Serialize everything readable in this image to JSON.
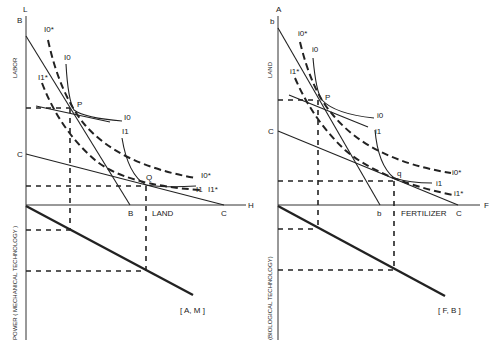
{
  "panels": [
    {
      "id": "mechanical",
      "axis_top": "L",
      "axis_right": "H",
      "y_label_upper": "LABOR",
      "y_label_lower": "POWER ( MECHANICAL TECHNOLOGY )",
      "x_label": "LAND",
      "intercept_top": "B",
      "intercept_mid": "C",
      "x_intercept_1": "B",
      "x_intercept_2": "C",
      "point_1": "P",
      "point_2": "Q",
      "curve_I0": "I0",
      "curve_I0_star": "I0*",
      "curve_I1": "I1",
      "curve_I1_star": "I1*",
      "bracket_label": "[ A, M ]"
    },
    {
      "id": "biological",
      "axis_top": "A",
      "axis_right": "F",
      "y_label_upper": "LAND",
      "y_label_lower": "(BIOLOGICAL TECHNOLOGY)",
      "x_label": "FERTILIZER",
      "intercept_top": "b",
      "intercept_mid": "C",
      "x_intercept_1": "b",
      "x_intercept_2": "C",
      "point_1": "P",
      "point_2": "q",
      "curve_I0": "i0",
      "curve_I0_star": "i0*",
      "curve_I1": "i1",
      "curve_I1_star": "i1*",
      "bracket_label": "[ F, B ]"
    }
  ]
}
